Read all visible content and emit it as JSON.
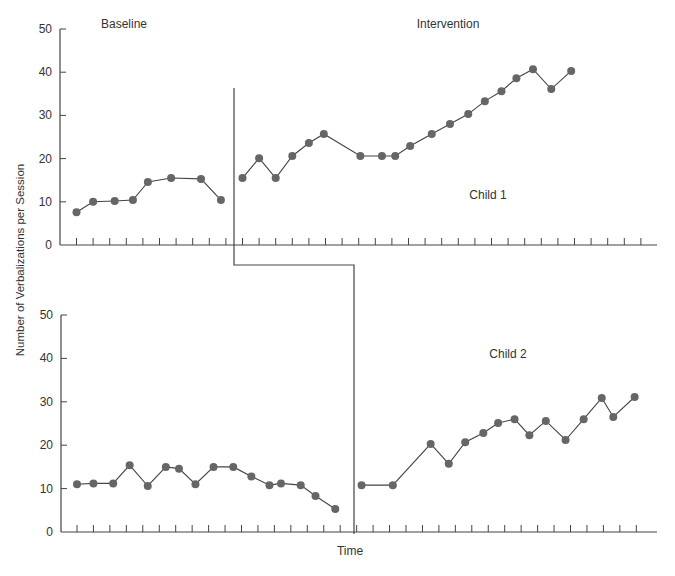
{
  "figure": {
    "ylabel": "Number of Verbalizations per Session",
    "xlabel": "Time",
    "phase_labels": {
      "baseline": "Baseline",
      "intervention": "Intervention"
    },
    "colors": {
      "axis": "#444444",
      "marker": "#666666",
      "line": "#444444",
      "text": "#333333"
    }
  },
  "chart_data": [
    {
      "type": "line",
      "title": "Child 1",
      "xlabel": "Time",
      "ylabel": "Number of Verbalizations per Session",
      "ylim": [
        0,
        50
      ],
      "yticks": [
        0,
        10,
        20,
        30,
        40,
        50
      ],
      "grid": false,
      "phases": [
        "Baseline",
        "Intervention"
      ],
      "phase_change_after_session": 10,
      "series": [
        {
          "name": "Baseline",
          "x": [
            1,
            2,
            3.3,
            4.4,
            5.3,
            6.7,
            8.5,
            9.7
          ],
          "values": [
            7.6,
            10.0,
            10.2,
            10.4,
            14.6,
            15.5,
            15.3,
            10.4
          ]
        },
        {
          "name": "Intervention",
          "x": [
            11,
            12,
            13,
            14,
            15,
            15.9,
            18.1,
            19.4,
            20.2,
            21.1,
            22.4,
            23.5,
            24.6,
            25.6,
            26.6,
            27.5,
            28.5,
            29.6,
            30.8
          ],
          "values": [
            15.5,
            20.1,
            15.5,
            20.6,
            23.6,
            25.7,
            20.6,
            20.6,
            20.6,
            22.9,
            25.7,
            28.0,
            30.3,
            33.3,
            35.6,
            38.6,
            40.7,
            36.1,
            40.3
          ]
        }
      ]
    },
    {
      "type": "line",
      "title": "Child 2",
      "xlabel": "Time",
      "ylabel": "Number of Verbalizations per Session",
      "ylim": [
        0,
        50
      ],
      "yticks": [
        0,
        10,
        20,
        30,
        40,
        50
      ],
      "grid": false,
      "phases": [
        "Baseline",
        "Intervention"
      ],
      "phase_change_after_session": 17,
      "series": [
        {
          "name": "Baseline",
          "x": [
            1,
            2,
            3.2,
            4.2,
            5.3,
            6.4,
            7.2,
            8.2,
            9.3,
            10.5,
            11.6,
            12.7,
            13.4,
            14.6,
            15.5,
            16.7
          ],
          "values": [
            11.0,
            11.2,
            11.2,
            15.4,
            10.6,
            15.0,
            14.6,
            11.0,
            15.0,
            15.0,
            12.8,
            10.8,
            11.2,
            10.8,
            8.3,
            5.3
          ]
        },
        {
          "name": "Intervention",
          "x": [
            18.3,
            20.2,
            22.5,
            23.6,
            24.6,
            25.7,
            26.6,
            27.6,
            28.5,
            29.5,
            30.7,
            31.8,
            32.9,
            33.6,
            34.9
          ],
          "values": [
            10.8,
            10.8,
            20.3,
            15.7,
            20.7,
            22.8,
            25.1,
            26.0,
            22.3,
            25.6,
            21.2,
            26.0,
            30.9,
            26.5,
            31.1
          ]
        }
      ]
    }
  ]
}
